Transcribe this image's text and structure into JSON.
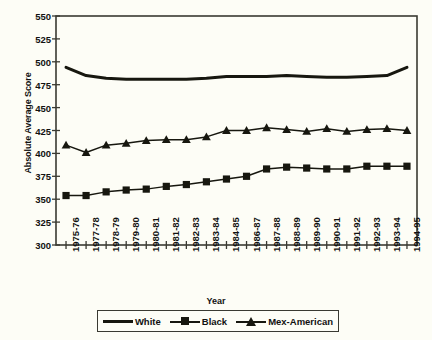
{
  "chart_data": {
    "type": "line",
    "title": "",
    "xlabel": "Year",
    "ylabel": "Absolute Average Score",
    "ylim": [
      300,
      550
    ],
    "yticks": [
      300,
      325,
      350,
      375,
      400,
      425,
      450,
      475,
      500,
      525,
      550
    ],
    "grid": false,
    "legend_position": "bottom",
    "categories": [
      "1975-76",
      "1977-78",
      "1978-79",
      "1979-80",
      "1980-81",
      "1981-82",
      "1982-83",
      "1983-84",
      "1984-85",
      "1986-87",
      "1987-88",
      "1988-89",
      "1989-90",
      "1990-91",
      "1991-92",
      "1992-93",
      "1993-94",
      "1994-95"
    ],
    "series": [
      {
        "name": "White",
        "marker": "none",
        "color": "#17170f",
        "values": [
          494,
          485,
          482,
          481,
          481,
          481,
          481,
          482,
          484,
          484,
          484,
          485,
          484,
          483,
          483,
          484,
          485,
          494
        ]
      },
      {
        "name": "Black",
        "marker": "square",
        "color": "#17170f",
        "values": [
          354,
          354,
          358,
          360,
          361,
          364,
          366,
          369,
          372,
          375,
          383,
          385,
          384,
          383,
          383,
          386,
          386,
          386
        ]
      },
      {
        "name": "Mex-American",
        "marker": "triangle",
        "color": "#17170f",
        "values": [
          409,
          401,
          409,
          411,
          414,
          415,
          415,
          418,
          425,
          425,
          428,
          426,
          424,
          427,
          424,
          426,
          427,
          425
        ]
      }
    ]
  },
  "legend": {
    "items": [
      {
        "label": "White",
        "marker": "none"
      },
      {
        "label": "Black",
        "marker": "square"
      },
      {
        "label": "Mex-American",
        "marker": "triangle"
      }
    ]
  }
}
